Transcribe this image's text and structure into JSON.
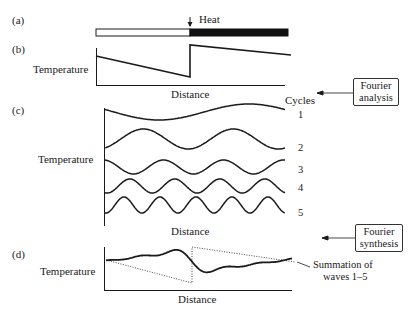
{
  "panels": {
    "a": {
      "label": "(a)",
      "heat_label": "Heat"
    },
    "b": {
      "label": "(b)",
      "ylabel": "Temperature",
      "xlabel": "Distance"
    },
    "c": {
      "label": "(c)",
      "ylabel": "Temperature",
      "xlabel": "Distance",
      "cycles_title": "Cycles",
      "cycles": [
        "1",
        "2",
        "3",
        "4",
        "5"
      ]
    },
    "d": {
      "label": "(d)",
      "ylabel": "Temperature",
      "xlabel": "Distance",
      "annotation_line1": "Summation of",
      "annotation_line2": "waves 1–5"
    }
  },
  "callouts": {
    "analysis_line1": "Fourier",
    "analysis_line2": "analysis",
    "synthesis_line1": "Fourier",
    "synthesis_line2": "synthesis"
  },
  "colors": {
    "ink": "#1a1a1a",
    "heated": "#111111",
    "unheated": "#ffffff"
  },
  "chart_data": [
    {
      "type": "line",
      "title": "(b) Temperature profile (sawtooth)",
      "xlabel": "Distance",
      "ylabel": "Temperature",
      "x": [
        0,
        0.5,
        0.5,
        1.0
      ],
      "values": [
        0.75,
        0.2,
        1.0,
        0.8
      ],
      "grid": false
    },
    {
      "type": "line",
      "title": "(c) Fourier components",
      "xlabel": "Distance",
      "ylabel": "Temperature",
      "series": [
        {
          "name": "1",
          "cycles": 1
        },
        {
          "name": "2",
          "cycles": 2
        },
        {
          "name": "3",
          "cycles": 3
        },
        {
          "name": "4",
          "cycles": 4
        },
        {
          "name": "5",
          "cycles": 5
        }
      ],
      "legend_title": "Cycles",
      "grid": false
    },
    {
      "type": "line",
      "title": "(d) Fourier synthesis",
      "xlabel": "Distance",
      "ylabel": "Temperature",
      "annotation": "Summation of waves 1–5",
      "grid": false
    }
  ]
}
